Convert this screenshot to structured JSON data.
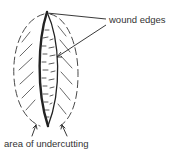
{
  "diagram": {
    "labels": {
      "wound_edges": "wound edges",
      "undercutting": "area of undercutting"
    },
    "colors": {
      "ink": "#222222",
      "label_text": "#333333",
      "background": "#ffffff"
    }
  }
}
